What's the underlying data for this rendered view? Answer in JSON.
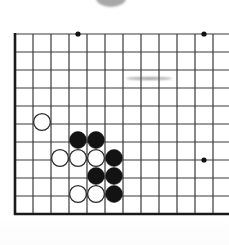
{
  "app": {
    "title": "Go board diagram",
    "kind": "goban-position-diagram",
    "description": "Scanned Go (Baduk/Weiqi) board section showing a local joseki fight near the lower left"
  },
  "board": {
    "name": "go-board",
    "background_color": "#ffffff",
    "line_color": "#3a3a3a",
    "border_color": "#1a1a1a",
    "grid_spacing": 18,
    "origin_x": 15,
    "origin_y": 34,
    "columns_visible": 12,
    "rows_visible": 11,
    "cropped_edges": [
      "right"
    ],
    "border_sides": [
      "left",
      "bottom"
    ],
    "line_width": 1.2,
    "border_width": 2.6
  },
  "star_points": {
    "name": "star-points",
    "color": "#111111",
    "radius": 2.6,
    "points": [
      {
        "col": 3,
        "row": 0,
        "x": 78,
        "y": 34
      },
      {
        "col": 10,
        "row": 0,
        "x": 204,
        "y": 34
      },
      {
        "col": 10,
        "row": 7,
        "x": 204,
        "y": 160
      }
    ]
  },
  "stones": {
    "radius": 8.4,
    "black_color": "#131313",
    "white_fill": "#ffffff",
    "white_edge": "#2b2b2b",
    "black_count": 6,
    "white_count": 6,
    "items": [
      {
        "color": "white",
        "col": 1.5,
        "row": 4.9,
        "x": 42,
        "y": 122,
        "label": "W1"
      },
      {
        "color": "black",
        "col": 3.5,
        "row": 5.9,
        "x": 78,
        "y": 140,
        "label": "B1"
      },
      {
        "color": "black",
        "col": 4.5,
        "row": 5.9,
        "x": 96,
        "y": 140,
        "label": "B2"
      },
      {
        "color": "white",
        "col": 2.5,
        "row": 6.9,
        "x": 60,
        "y": 158,
        "label": "W2"
      },
      {
        "color": "white",
        "col": 3.5,
        "row": 6.9,
        "x": 78,
        "y": 158,
        "label": "W3"
      },
      {
        "color": "white",
        "col": 4.5,
        "row": 6.9,
        "x": 96,
        "y": 158,
        "label": "W4"
      },
      {
        "color": "black",
        "col": 5.5,
        "row": 6.9,
        "x": 114,
        "y": 158,
        "label": "B3"
      },
      {
        "color": "black",
        "col": 4.5,
        "row": 7.9,
        "x": 96,
        "y": 176,
        "label": "B4"
      },
      {
        "color": "black",
        "col": 5.5,
        "row": 7.9,
        "x": 114,
        "y": 176,
        "label": "B5"
      },
      {
        "color": "white",
        "col": 3.5,
        "row": 8.9,
        "x": 78,
        "y": 194,
        "label": "W5"
      },
      {
        "color": "white",
        "col": 4.5,
        "row": 8.9,
        "x": 96,
        "y": 194,
        "label": "W6"
      },
      {
        "color": "black",
        "col": 5.5,
        "row": 8.9,
        "x": 114,
        "y": 194,
        "label": "B6"
      }
    ]
  },
  "artifacts": {
    "name": "scan-artifacts",
    "top_blob": {
      "name": "gray-semicircle-artifact",
      "x": 96,
      "y": -11,
      "width": 30,
      "height": 18,
      "color": "#9a9a9a"
    },
    "smudge": {
      "name": "horizontal-smudge-artifact",
      "x": 126,
      "y": 77,
      "width": 46,
      "height": 3,
      "color": "#555555"
    }
  }
}
